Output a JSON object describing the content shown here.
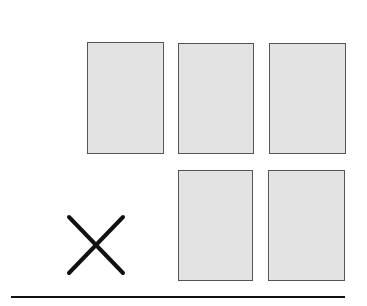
{
  "diagram": {
    "cards": [
      {
        "row": 1,
        "col": 1,
        "x": 87,
        "y": 42,
        "w": 77,
        "h": 112
      },
      {
        "row": 1,
        "col": 2,
        "x": 178,
        "y": 43,
        "w": 76,
        "h": 111
      },
      {
        "row": 1,
        "col": 3,
        "x": 269,
        "y": 43,
        "w": 77,
        "h": 111
      },
      {
        "row": 2,
        "col": 2,
        "x": 178,
        "y": 170,
        "w": 75,
        "h": 111
      },
      {
        "row": 2,
        "col": 3,
        "x": 268,
        "y": 170,
        "w": 77,
        "h": 111
      }
    ],
    "missing_marker": {
      "symbol": "X",
      "row": 2,
      "col": 1
    },
    "colors": {
      "card_fill": "#e3e3e3",
      "card_border": "#555555",
      "line": "#111111"
    }
  }
}
